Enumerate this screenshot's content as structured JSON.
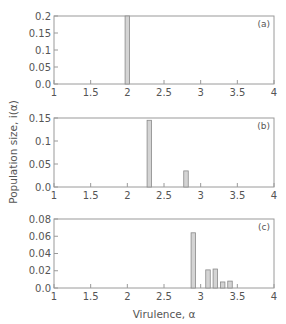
{
  "chart_data": [
    {
      "type": "bar",
      "panel": "(a)",
      "x": [
        2.0
      ],
      "values": [
        0.2
      ],
      "xlim": [
        1,
        4
      ],
      "ylim": [
        0,
        0.2
      ],
      "xticks": [
        "1",
        "1.5",
        "2",
        "2.5",
        "3",
        "3.5",
        "4"
      ],
      "yticks": [
        "0.0",
        "0.05",
        "0.1",
        "0.15",
        "0.2"
      ],
      "grid": false
    },
    {
      "type": "bar",
      "panel": "(b)",
      "x": [
        2.3,
        2.8
      ],
      "values": [
        0.145,
        0.035
      ],
      "xlim": [
        1,
        4
      ],
      "ylim": [
        0,
        0.15
      ],
      "xticks": [
        "1",
        "1.5",
        "2",
        "2.5",
        "3",
        "3.5",
        "4"
      ],
      "yticks": [
        "0.0",
        "0.05",
        "0.1",
        "0.15"
      ],
      "grid": false
    },
    {
      "type": "bar",
      "panel": "(c)",
      "x": [
        2.9,
        3.1,
        3.2,
        3.3,
        3.4
      ],
      "values": [
        0.064,
        0.021,
        0.022,
        0.007,
        0.008
      ],
      "xlim": [
        1,
        4
      ],
      "ylim": [
        0,
        0.08
      ],
      "xticks": [
        "1",
        "1.5",
        "2",
        "2.5",
        "3",
        "3.5",
        "4"
      ],
      "yticks": [
        "0.0",
        "0.02",
        "0.04",
        "0.06",
        "0.08"
      ],
      "grid": false
    }
  ],
  "labels": {
    "xlabel": "Virulence, α",
    "ylabel": "Population size, i(α)"
  },
  "colors": {
    "bar_fill": "#d4d4d4",
    "bar_stroke": "#8a8a8a",
    "axis": "#9a9a9a",
    "text": "#555555"
  }
}
